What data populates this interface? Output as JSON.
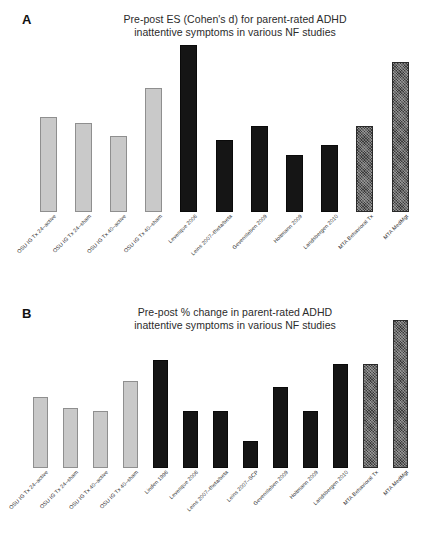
{
  "figure": {
    "panels": [
      {
        "letter": "A",
        "title_line1": "Pre-post ES (Cohen's d) for parent-rated ADHD",
        "title_line2": "inattentive symptoms in various NF studies"
      },
      {
        "letter": "B",
        "title_line1": "Pre-post % change in parent-rated ADHD",
        "title_line2": "inattentive symptoms in various NF studies"
      }
    ]
  },
  "colors": {
    "light_bar": "#c9c9c9",
    "light_bar_border": "#8f8f8f",
    "dark_bar": "#151515",
    "hatched_bar": "#3a3a3a",
    "background": "#ffffff",
    "text": "#2b2b2b"
  },
  "chart_data": [
    {
      "type": "bar",
      "panel": "A",
      "title": "Pre-post ES (Cohen's d) for parent-rated ADHD inattentive symptoms in various NF studies",
      "xlabel": "",
      "ylabel": "Effect size (Cohen's d)",
      "grid": false,
      "legend": "none",
      "ylim": [
        0,
        1.0
      ],
      "categories": [
        "OSU IG Tx 24–active",
        "OSU IG Tx 24–sham",
        "OSU IG Tx 40–active",
        "OSU IG Tx 40–sham",
        "Levesque 2006",
        "Leins 2007–theta/beta",
        "Gevensleben 2009",
        "Holtmann 2009",
        "Landsbergen 2010",
        "MTA Behavioral Tx",
        "MTA MedMgt"
      ],
      "values": [
        0.55,
        0.52,
        0.44,
        0.72,
        0.97,
        0.42,
        0.5,
        0.33,
        0.39,
        0.5,
        0.87
      ],
      "bar_styles": [
        "light",
        "light",
        "light",
        "light",
        "dark",
        "dark",
        "dark",
        "dark",
        "dark",
        "hatched",
        "hatched"
      ]
    },
    {
      "type": "bar",
      "panel": "B",
      "title": "Pre-post % change in parent-rated ADHD inattentive symptoms in various NF studies",
      "xlabel": "",
      "ylabel": "% change",
      "grid": false,
      "legend": "none",
      "ylim": [
        0,
        50
      ],
      "categories": [
        "OSU IG Tx 24–active",
        "OSU IG Tx 24–sham",
        "OSU IG Tx 40–active",
        "OSU IG Tx 40–sham",
        "Linden 1996",
        "Levesque 2006",
        "Leins 2007–theta/beta",
        "Leins 2007–SCP",
        "Gevensleben 2009",
        "Holtmann 2009",
        "Landsbergen 2010",
        "MTA Behavioral Tx",
        "MTA MedMgt"
      ],
      "values": [
        21,
        18,
        17,
        26,
        32,
        17,
        17,
        8,
        24,
        17,
        31,
        31,
        44
      ],
      "bar_styles": [
        "light",
        "light",
        "light",
        "light",
        "dark",
        "dark",
        "dark",
        "dark",
        "dark",
        "dark",
        "dark",
        "hatched",
        "hatched"
      ]
    }
  ]
}
